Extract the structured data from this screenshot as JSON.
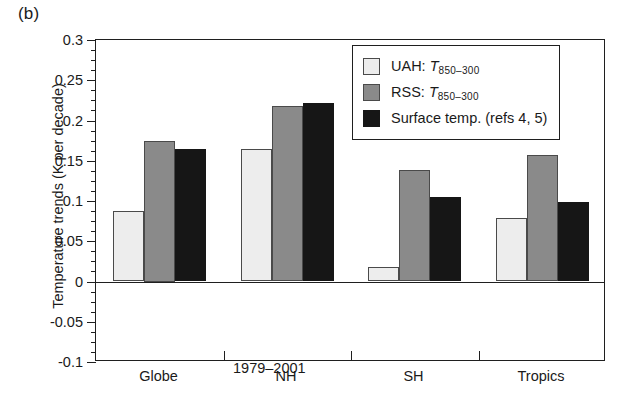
{
  "panel": {
    "label": "(b)"
  },
  "axes": {
    "y_title": "Temperature trends (K per decade)",
    "y_ticks": [
      "0.3",
      "0.25",
      "0.2",
      "0.15",
      "0.1",
      "0.05",
      "0",
      "-0.05",
      "-0.1"
    ],
    "x_labels": [
      "Globe",
      "NH",
      "SH",
      "Tropics"
    ]
  },
  "annotation": {
    "period": "1979–2001"
  },
  "legend": {
    "entries": [
      {
        "key": "uah",
        "prefix": "UAH: ",
        "symbol": "T",
        "subscript": "850–300",
        "color": "#ededed"
      },
      {
        "key": "rss",
        "prefix": "RSS: ",
        "symbol": "T",
        "subscript": "850–300",
        "color": "#8a8a8a"
      },
      {
        "key": "surface",
        "prefix": "Surface temp. (refs 4, 5)",
        "symbol": "",
        "subscript": "",
        "color": "#161616"
      }
    ]
  },
  "chart_data": {
    "type": "bar",
    "title": "",
    "xlabel": "",
    "ylabel": "Temperature trends (K per decade)",
    "ylim": [
      -0.1,
      0.3
    ],
    "ytick_step": 0.05,
    "yminor_step": 0.0125,
    "grid": false,
    "legend_position": "upper-center-right",
    "annotation": "1979–2001",
    "categories": [
      "Globe",
      "NH",
      "SH",
      "Tropics"
    ],
    "series": [
      {
        "name": "UAH: T850-300",
        "color": "#ededed",
        "values": [
          0.088,
          0.164,
          0.018,
          0.079
        ]
      },
      {
        "name": "RSS: T850-300",
        "color": "#8a8a8a",
        "values": [
          0.175,
          0.218,
          0.138,
          0.157
        ]
      },
      {
        "name": "Surface temp. (refs 4, 5)",
        "color": "#161616",
        "values": [
          0.164,
          0.222,
          0.105,
          0.099
        ]
      }
    ]
  }
}
